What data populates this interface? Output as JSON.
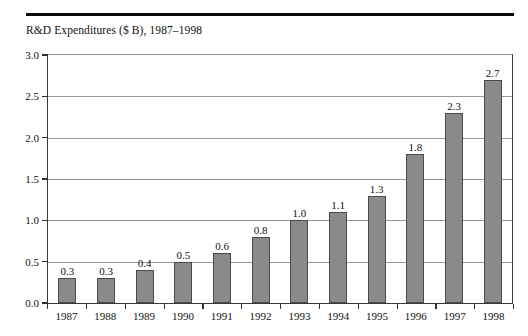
{
  "chart_data": {
    "type": "bar",
    "title": "R&D Expenditures ($ B), 1987–1998",
    "xlabel": "",
    "ylabel": "",
    "categories": [
      "1987",
      "1988",
      "1989",
      "1990",
      "1991",
      "1992",
      "1993",
      "1994",
      "1995",
      "1996",
      "1997",
      "1998"
    ],
    "values": [
      0.3,
      0.3,
      0.4,
      0.5,
      0.6,
      0.8,
      1.0,
      1.1,
      1.3,
      1.8,
      2.3,
      2.7
    ],
    "value_labels": [
      "0.3",
      "0.3",
      "0.4",
      "0.5",
      "0.6",
      "0.8",
      "1.0",
      "1.1",
      "1.3",
      "1.8",
      "2.3",
      "2.7"
    ],
    "ylim": [
      0.0,
      3.0
    ],
    "yticks": [
      0.0,
      0.5,
      1.0,
      1.5,
      2.0,
      2.5,
      3.0
    ],
    "ytick_labels": [
      "0.0",
      "0.5",
      "1.0",
      "1.5",
      "2.0",
      "2.5",
      "3.0"
    ],
    "grid": true,
    "legend": false,
    "bar_color": "#8a8a8a",
    "bar_edge_color": "#4a4a4a",
    "gridline_color": "#9a9a9a",
    "axis_color": "#3a3a3a",
    "background_color": "#ffffff",
    "text_color": "#111111"
  }
}
